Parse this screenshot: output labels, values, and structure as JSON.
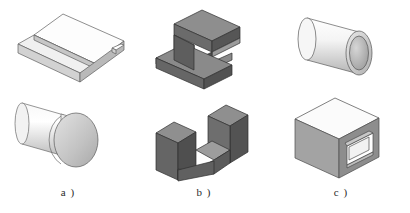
{
  "figure": {
    "background_color": "#ffffff",
    "panel_count": 3
  },
  "palette": {
    "light_top": "#fdfdfd",
    "light_front": "#d9d9d9",
    "light_side": "#bfbfbf",
    "light_edge": "#6e6e6e",
    "dark_top": "#8e8e8e",
    "dark_front": "#6a6a6a",
    "dark_side": "#515151",
    "dark_cavity": "#b3b3b3",
    "dark_edge": "#2f2f2f",
    "mid_top": "#f2f2f2",
    "mid_front": "#a8a8a8",
    "mid_side": "#909090",
    "outline": "#4a4a4a",
    "caption_color": "#2b2b2b"
  },
  "panels": [
    {
      "id": "a",
      "caption": "a )",
      "tone": "light",
      "shapes": [
        {
          "name": "stepped-plate",
          "position": "top",
          "description": "Rectangular plate with a raised step / ledge along one long edge and a small notch at the right corner"
        },
        {
          "name": "flanged-cylinder",
          "position": "bottom",
          "description": "Cylindrical shaft terminating in a larger circular disc head, like a rivet or flanged pin"
        }
      ]
    },
    {
      "id": "b",
      "caption": "b )",
      "tone": "dark",
      "shapes": [
        {
          "name": "c-channel-block",
          "position": "top",
          "description": "C-shaped (I-beam profile) block with a rectangular slot cut into its right face"
        },
        {
          "name": "u-channel-block",
          "position": "bottom",
          "description": "U-shaped channel block open at the top with two upright walls and a connecting base"
        }
      ]
    },
    {
      "id": "c",
      "caption": "c )",
      "tone": "mid",
      "shapes": [
        {
          "name": "hollow-tube",
          "position": "top",
          "description": "Hollow cylindrical tube / pipe segment showing its annular wall and inner bore"
        },
        {
          "name": "box-with-through-hole",
          "position": "bottom",
          "description": "Cube shaped box with a square through hole cut in the front and back faces"
        }
      ]
    }
  ]
}
